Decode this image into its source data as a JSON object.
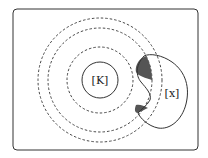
{
  "diagram": {
    "labels": {
      "center": "[K]",
      "blob": "[x]"
    },
    "colors": {
      "stroke": "#2a2a2a",
      "shading": "#555555",
      "background": "#ffffff"
    },
    "rings": {
      "solid_count": 1,
      "dashed_count": 3
    }
  }
}
